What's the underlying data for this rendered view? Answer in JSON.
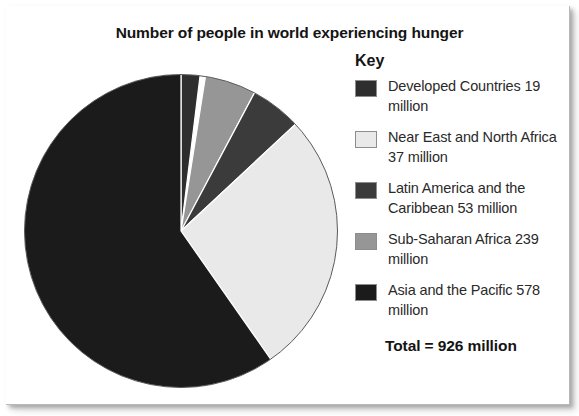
{
  "chart_title": "Number of people in world experiencing hunger",
  "legend": {
    "title": "Key",
    "total_label": "Total = 926 million",
    "entries": [
      {
        "label": "Developed Countries 19 million",
        "name": "Developed Countries",
        "value": 19,
        "unit": "million",
        "color": "#2e2e2e"
      },
      {
        "label": "Near East and North Africa 37 million",
        "name": "Near East and North Africa",
        "value": 37,
        "unit": "million",
        "color": "#e9e9e9"
      },
      {
        "label": "Latin America and the Caribbean 53 million",
        "name": "Latin America and the Caribbean",
        "value": 53,
        "unit": "million",
        "color": "#3b3b3b"
      },
      {
        "label": "Sub-Saharan Africa 239 million",
        "name": "Sub-Saharan Africa",
        "value": 239,
        "unit": "million",
        "color": "#969696"
      },
      {
        "label": "Asia and the Pacific 578 million",
        "name": "Asia and the Pacific",
        "value": 578,
        "unit": "million",
        "color": "#1b1b1b"
      }
    ]
  },
  "chart_data": {
    "type": "pie",
    "title": "Number of people in world experiencing hunger",
    "xlabel": "",
    "ylabel": "",
    "unit": "million people",
    "total": 926,
    "total_label": "Total = 926 million",
    "legend_position": "right",
    "legend_title": "Key",
    "grid": false,
    "categories": [
      "Developed Countries",
      "Near East and North Africa",
      "Latin America and the Caribbean",
      "Sub-Saharan Africa",
      "Asia and the Pacific"
    ],
    "values": [
      19,
      37,
      53,
      239,
      578
    ],
    "colors": [
      "#2e2e2e",
      "#e9e9e9",
      "#3b3b3b",
      "#969696",
      "#1b1b1b"
    ],
    "slices": [
      {
        "label": "Developed Countries",
        "value": 19,
        "percent": 2.1,
        "color": "#2e2e2e",
        "start_deg": 0,
        "end_deg": 7,
        "draw_order": 1
      },
      {
        "label": "Sub-Saharan Africa",
        "value": 239,
        "percent": 25.8,
        "color": "#969696",
        "start_deg": 9,
        "end_deg": 28,
        "draw_order": 2
      },
      {
        "label": "Latin America and the Caribbean",
        "value": 53,
        "percent": 5.7,
        "color": "#3b3b3b",
        "start_deg": 28,
        "end_deg": 47,
        "draw_order": 3
      },
      {
        "label": "Near East and North Africa",
        "value": 37,
        "percent": 4.0,
        "color": "#e9e9e9",
        "start_deg": 47,
        "end_deg": 145,
        "draw_order": 4
      },
      {
        "label": "Asia and the Pacific",
        "value": 578,
        "percent": 62.4,
        "color": "#1b1b1b",
        "start_deg": 145,
        "end_deg": 360,
        "draw_order": 5
      }
    ],
    "geometry": {
      "cx": 158,
      "cy": 159,
      "r": 157,
      "stroke": "#5a5a5a",
      "stroke_width": 1
    }
  }
}
